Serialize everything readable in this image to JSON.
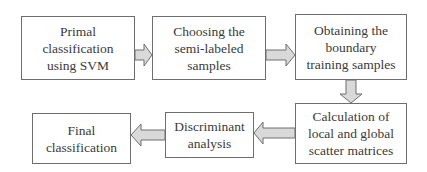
{
  "diagram": {
    "type": "flowchart",
    "nodes": [
      {
        "id": "n1",
        "lines": [
          "Primal",
          "classification",
          "using SVM"
        ]
      },
      {
        "id": "n2",
        "lines": [
          "Choosing the",
          "semi-labeled",
          "samples"
        ]
      },
      {
        "id": "n3",
        "lines": [
          "Obtaining the",
          "boundary",
          "training samples"
        ]
      },
      {
        "id": "n4",
        "lines": [
          "Calculation of",
          "local and global",
          "scatter matrices"
        ]
      },
      {
        "id": "n5",
        "lines": [
          "Discriminant",
          "analysis"
        ]
      },
      {
        "id": "n6",
        "lines": [
          "Final",
          "classification"
        ]
      }
    ],
    "edges": [
      {
        "from": "n1",
        "to": "n2",
        "direction": "right"
      },
      {
        "from": "n2",
        "to": "n3",
        "direction": "right"
      },
      {
        "from": "n3",
        "to": "n4",
        "direction": "down"
      },
      {
        "from": "n4",
        "to": "n5",
        "direction": "left"
      },
      {
        "from": "n5",
        "to": "n6",
        "direction": "left"
      }
    ],
    "colors": {
      "border": "#6e6e6e",
      "arrow_fill": "#d9d9d9",
      "arrow_stroke": "#6e6e6e",
      "text": "#3a3a3a"
    }
  }
}
